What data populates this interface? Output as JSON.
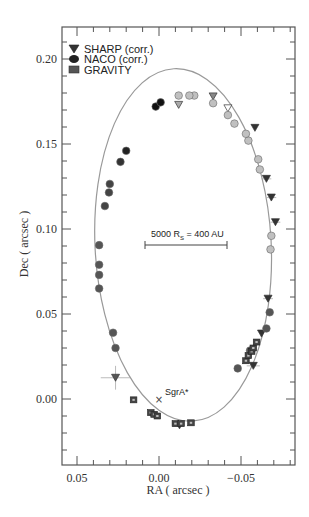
{
  "chart_data": {
    "type": "scatter",
    "title": "",
    "xlabel": "RA ( arcsec )",
    "ylabel": "Dec ( arcsec )",
    "xlim": [
      0.062,
      -0.083
    ],
    "ylim": [
      -0.039,
      0.225
    ],
    "x_ticks": [
      {
        "value": 0.05,
        "label": "0.05"
      },
      {
        "value": 0.0,
        "label": "0.00"
      },
      {
        "value": -0.05,
        "label": "-0.05"
      }
    ],
    "y_ticks": [
      {
        "value": 0.0,
        "label": "0.00"
      },
      {
        "value": 0.05,
        "label": "0.05"
      },
      {
        "value": 0.1,
        "label": "0.10"
      },
      {
        "value": 0.15,
        "label": "0.15"
      },
      {
        "value": 0.2,
        "label": "0.20"
      }
    ],
    "x_minor_step": 0.01,
    "y_minor_step": 0.01,
    "grid": false,
    "legend_position": "upper-left",
    "legend": [
      {
        "label": "SHARP (corr.)",
        "marker": "triangle-down",
        "color": "#333333"
      },
      {
        "label": "NACO (corr.)",
        "marker": "circle",
        "color": "#222222"
      },
      {
        "label": "GRAVITY",
        "marker": "square",
        "color": "#444444"
      }
    ],
    "orbit_fit": {
      "type": "ellipse",
      "color": "#999999",
      "center": [
        -0.0147,
        0.0906
      ],
      "semi_x": 0.0537,
      "semi_y": 0.1038,
      "rotation_deg": -3
    },
    "annotations": [
      {
        "text": "SgrA*",
        "x": 0.0,
        "y": -0.003,
        "marker": "x"
      },
      {
        "text": "5000 R_S = 400 AU",
        "type": "scale-bar",
        "x_from": 0.0085,
        "x_to": -0.0415,
        "y": 0.091
      }
    ],
    "series": [
      {
        "name": "SHARP (corr.)",
        "marker": "triangle-down",
        "points": [
          {
            "x": 0.0265,
            "y": 0.0125,
            "color": "#555555",
            "xerr": 0.009,
            "yerr": 0.007
          },
          {
            "x": -0.0125,
            "y": -0.0155,
            "color": "#333333"
          },
          {
            "x": -0.0575,
            "y": 0.0195,
            "color": "#333333",
            "xerr": 0.004
          },
          {
            "x": -0.0625,
            "y": 0.0385,
            "color": "#333333"
          },
          {
            "x": -0.0665,
            "y": 0.059,
            "color": "#333333",
            "xerr": 0.003
          },
          {
            "x": -0.071,
            "y": 0.104,
            "color": "#333333",
            "xerr": 0.003
          },
          {
            "x": -0.0685,
            "y": 0.1185,
            "color": "#333333",
            "xerr": 0.003
          },
          {
            "x": -0.0655,
            "y": 0.1295,
            "color": "#333333",
            "xerr": 0.003
          },
          {
            "x": -0.0585,
            "y": 0.1595,
            "color": "#333333"
          },
          {
            "x": -0.042,
            "y": 0.171,
            "color": "#ffffff"
          },
          {
            "x": -0.033,
            "y": 0.178,
            "color": "#888888"
          },
          {
            "x": -0.012,
            "y": 0.173,
            "color": "#aaaaaa"
          }
        ]
      },
      {
        "name": "NACO (corr.)",
        "marker": "circle",
        "points": [
          {
            "x": 0.0365,
            "y": 0.065,
            "color": "#555555"
          },
          {
            "x": 0.0365,
            "y": 0.073,
            "color": "#555555"
          },
          {
            "x": 0.0365,
            "y": 0.079,
            "color": "#555555"
          },
          {
            "x": 0.0365,
            "y": 0.0905,
            "color": "#555555"
          },
          {
            "x": 0.033,
            "y": 0.1135,
            "color": "#444444"
          },
          {
            "x": 0.0305,
            "y": 0.1215,
            "color": "#444444"
          },
          {
            "x": 0.03,
            "y": 0.1265,
            "color": "#444444"
          },
          {
            "x": 0.0235,
            "y": 0.1395,
            "color": "#333333"
          },
          {
            "x": 0.02,
            "y": 0.146,
            "color": "#222222"
          },
          {
            "x": 0.002,
            "y": 0.172,
            "color": "#111111"
          },
          {
            "x": -0.001,
            "y": 0.1745,
            "color": "#111111"
          },
          {
            "x": 0.028,
            "y": 0.039,
            "color": "#555555"
          },
          {
            "x": 0.0265,
            "y": 0.03,
            "color": "#555555"
          },
          {
            "x": -0.048,
            "y": 0.018,
            "color": "#555555"
          },
          {
            "x": -0.0555,
            "y": 0.0285,
            "color": "#555555"
          },
          {
            "x": -0.0655,
            "y": 0.0415,
            "color": "#555555"
          },
          {
            "x": -0.0675,
            "y": 0.051,
            "color": "#555555"
          },
          {
            "x": -0.068,
            "y": 0.088,
            "color": "#c0c0c0"
          },
          {
            "x": -0.0685,
            "y": 0.096,
            "color": "#c0c0c0"
          },
          {
            "x": -0.0615,
            "y": 0.135,
            "color": "#c0c0c0"
          },
          {
            "x": -0.0605,
            "y": 0.141,
            "color": "#c0c0c0"
          },
          {
            "x": -0.0545,
            "y": 0.152,
            "color": "#c0c0c0"
          },
          {
            "x": -0.053,
            "y": 0.156,
            "color": "#c0c0c0"
          },
          {
            "x": -0.046,
            "y": 0.162,
            "color": "#c0c0c0"
          },
          {
            "x": -0.042,
            "y": 0.167,
            "color": "#c0c0c0"
          },
          {
            "x": -0.033,
            "y": 0.174,
            "color": "#c0c0c0"
          },
          {
            "x": -0.0215,
            "y": 0.1785,
            "color": "#c0c0c0"
          },
          {
            "x": -0.0185,
            "y": 0.1785,
            "color": "#c0c0c0"
          },
          {
            "x": -0.012,
            "y": 0.1785,
            "color": "#c0c0c0"
          }
        ]
      },
      {
        "name": "GRAVITY",
        "marker": "square",
        "points": [
          {
            "x": 0.0155,
            "y": -0.0005,
            "color": "#444444"
          },
          {
            "x": 0.005,
            "y": -0.008,
            "color": "#444444"
          },
          {
            "x": 0.003,
            "y": -0.009,
            "color": "#444444"
          },
          {
            "x": 0.001,
            "y": -0.01,
            "color": "#444444"
          },
          {
            "x": -0.01,
            "y": -0.0145,
            "color": "#444444"
          },
          {
            "x": -0.0135,
            "y": -0.0145,
            "color": "#444444"
          },
          {
            "x": -0.0195,
            "y": -0.014,
            "color": "#444444"
          },
          {
            "x": -0.053,
            "y": 0.0225,
            "color": "#444444"
          },
          {
            "x": -0.0545,
            "y": 0.0255,
            "color": "#444444"
          },
          {
            "x": -0.0565,
            "y": 0.028,
            "color": "#444444"
          },
          {
            "x": -0.0575,
            "y": 0.03,
            "color": "#444444"
          },
          {
            "x": -0.0595,
            "y": 0.0335,
            "color": "#444444"
          }
        ]
      }
    ]
  },
  "labels": {
    "legend_sharp": "SHARP (corr.)",
    "legend_naco": "NACO (corr.)",
    "legend_gravity": "GRAVITY",
    "x_axis_title": "RA ( arcsec )",
    "y_axis_title": "Dec ( arcsec )",
    "sgra": "SgrA*",
    "scale_main": "5000 R",
    "scale_sub": "S",
    "scale_rest": " = 400 AU"
  }
}
